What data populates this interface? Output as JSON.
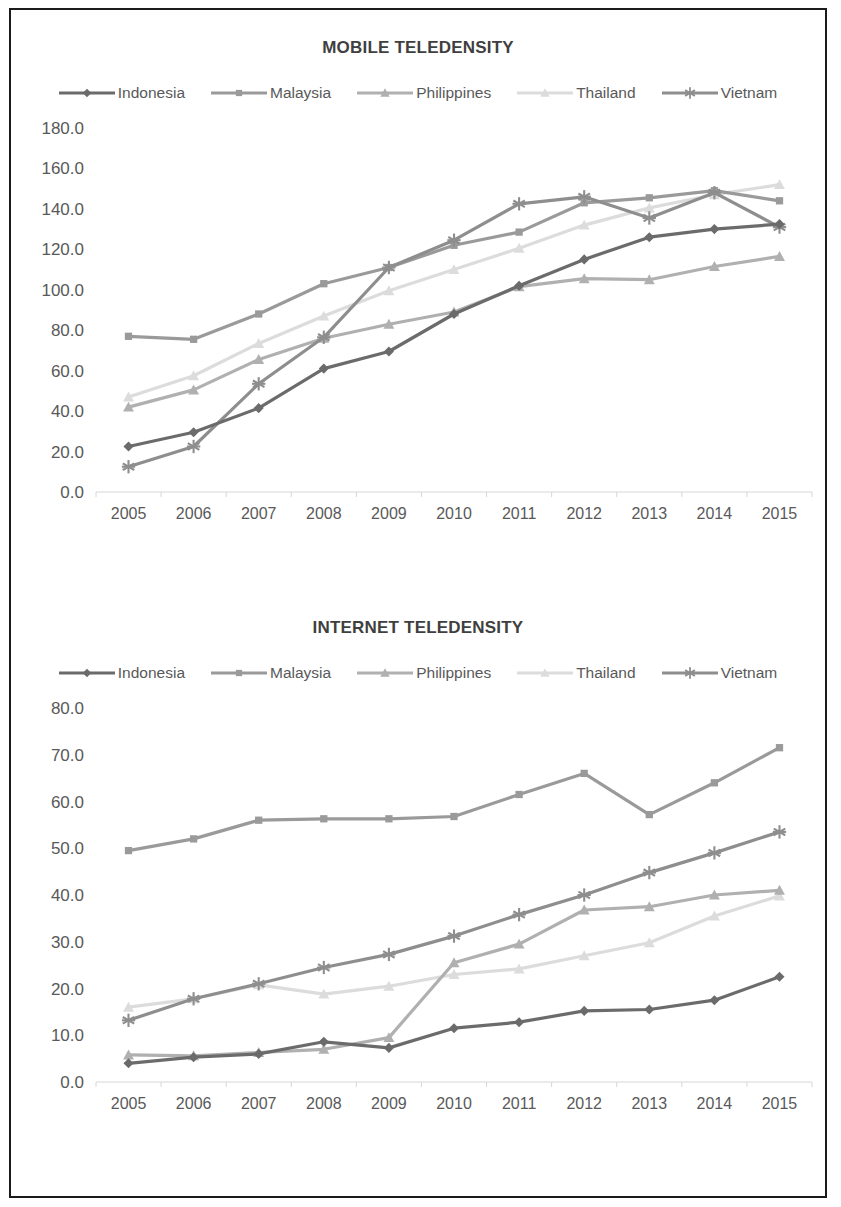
{
  "document": {
    "border_color": "#1b1b1b",
    "background": "#ffffff"
  },
  "series_style": {
    "Indonesia": {
      "color": "#6b6b6b",
      "marker": "diamond"
    },
    "Malaysia": {
      "color": "#9a9a9a",
      "marker": "square"
    },
    "Philippines": {
      "color": "#b0b0b0",
      "marker": "triangle"
    },
    "Thailand": {
      "color": "#dcdcdc",
      "marker": "triangle"
    },
    "Vietnam": {
      "color": "#8e8e8e",
      "marker": "asterisk"
    }
  },
  "charts": [
    {
      "id": "mobile",
      "title": "MOBILE TELEDENSITY",
      "legend": [
        "Indonesia",
        "Malaysia",
        "Philippines",
        "Thailand",
        "Vietnam"
      ]
    },
    {
      "id": "internet",
      "title": "INTERNET TELEDENSITY",
      "legend": [
        "Indonesia",
        "Malaysia",
        "Philippines",
        "Thailand",
        "Vietnam"
      ]
    }
  ],
  "chart_data": [
    {
      "type": "line",
      "title": "MOBILE TELEDENSITY",
      "xlabel": "",
      "ylabel": "",
      "categories": [
        "2005",
        "2006",
        "2007",
        "2008",
        "2009",
        "2010",
        "2011",
        "2012",
        "2013",
        "2014",
        "2015"
      ],
      "ylim": [
        0.0,
        180.0
      ],
      "ytick_step": 20.0,
      "yticks": [
        "0.0",
        "20.0",
        "40.0",
        "60.0",
        "80.0",
        "100.0",
        "120.0",
        "140.0",
        "160.0",
        "180.0"
      ],
      "grid": false,
      "legend_position": "top",
      "series": [
        {
          "name": "Indonesia",
          "values": [
            22.5,
            29.5,
            41.5,
            61.0,
            69.5,
            88.0,
            102.0,
            115.0,
            126.0,
            130.0,
            132.5
          ]
        },
        {
          "name": "Malaysia",
          "values": [
            77.0,
            75.5,
            88.0,
            103.0,
            111.0,
            122.0,
            128.5,
            143.0,
            145.5,
            149.0,
            144.0
          ]
        },
        {
          "name": "Philippines",
          "values": [
            42.0,
            50.5,
            65.5,
            76.0,
            83.0,
            89.0,
            101.5,
            105.5,
            105.0,
            111.5,
            116.5
          ]
        },
        {
          "name": "Thailand",
          "values": [
            47.0,
            57.5,
            73.5,
            87.0,
            99.5,
            110.0,
            120.5,
            132.0,
            140.5,
            147.0,
            152.0
          ]
        },
        {
          "name": "Vietnam",
          "values": [
            12.5,
            22.5,
            53.5,
            76.5,
            111.0,
            124.5,
            142.5,
            146.0,
            135.5,
            148.0,
            131.0
          ]
        }
      ]
    },
    {
      "type": "line",
      "title": "INTERNET TELEDENSITY",
      "xlabel": "",
      "ylabel": "",
      "categories": [
        "2005",
        "2006",
        "2007",
        "2008",
        "2009",
        "2010",
        "2011",
        "2012",
        "2013",
        "2014",
        "2015"
      ],
      "ylim": [
        0.0,
        80.0
      ],
      "ytick_step": 10.0,
      "yticks": [
        "0.0",
        "10.0",
        "20.0",
        "30.0",
        "40.0",
        "50.0",
        "60.0",
        "70.0",
        "80.0"
      ],
      "grid": false,
      "legend_position": "top",
      "series": [
        {
          "name": "Indonesia",
          "values": [
            4.0,
            5.3,
            6.0,
            8.6,
            7.3,
            11.5,
            12.8,
            15.2,
            15.5,
            17.5,
            22.5
          ]
        },
        {
          "name": "Malaysia",
          "values": [
            49.5,
            52.0,
            56.0,
            56.3,
            56.3,
            56.8,
            61.5,
            66.0,
            57.2,
            64.0,
            71.5
          ]
        },
        {
          "name": "Philippines",
          "values": [
            5.8,
            5.6,
            6.3,
            7.0,
            9.5,
            25.5,
            29.5,
            36.8,
            37.5,
            40.0,
            41.0
          ]
        },
        {
          "name": "Thailand",
          "values": [
            16.0,
            17.8,
            20.8,
            18.8,
            20.5,
            23.0,
            24.2,
            27.0,
            29.8,
            35.5,
            39.8
          ]
        },
        {
          "name": "Vietnam",
          "values": [
            13.2,
            17.8,
            21.0,
            24.5,
            27.3,
            31.2,
            35.8,
            40.0,
            44.8,
            49.0,
            53.5
          ]
        }
      ]
    }
  ]
}
